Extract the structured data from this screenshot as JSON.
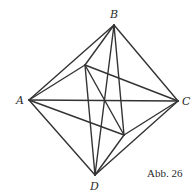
{
  "caption": "Abb. 26",
  "points": {
    "A": {
      "label": "A",
      "x": 29,
      "y": 100
    },
    "B": {
      "label": "B",
      "x": 114,
      "y": 25
    },
    "C": {
      "label": "C",
      "x": 178,
      "y": 101
    },
    "D": {
      "label": "D",
      "x": 95,
      "y": 175
    },
    "P": {
      "label": "",
      "x": 85,
      "y": 65
    },
    "Q": {
      "label": "",
      "x": 124,
      "y": 135
    }
  },
  "edges": [
    [
      "A",
      "B"
    ],
    [
      "B",
      "C"
    ],
    [
      "C",
      "D"
    ],
    [
      "D",
      "A"
    ],
    [
      "A",
      "C"
    ],
    [
      "B",
      "D"
    ],
    [
      "A",
      "P"
    ],
    [
      "P",
      "C"
    ],
    [
      "A",
      "Q"
    ],
    [
      "Q",
      "C"
    ],
    [
      "P",
      "Q"
    ],
    [
      "B",
      "P"
    ],
    [
      "B",
      "Q"
    ],
    [
      "D",
      "P"
    ],
    [
      "D",
      "Q"
    ]
  ]
}
